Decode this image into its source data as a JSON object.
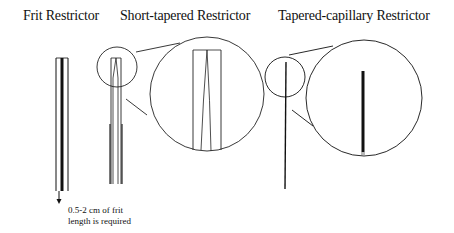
{
  "titles": {
    "frit": "Frit Restrictor",
    "short_tapered": "Short-tapered Restrictor",
    "tapered_capillary": "Tapered-capillary Restrictor"
  },
  "annotations": {
    "frit_note_line1": "0.5-2 cm of frit",
    "frit_note_line2": "length is required"
  }
}
